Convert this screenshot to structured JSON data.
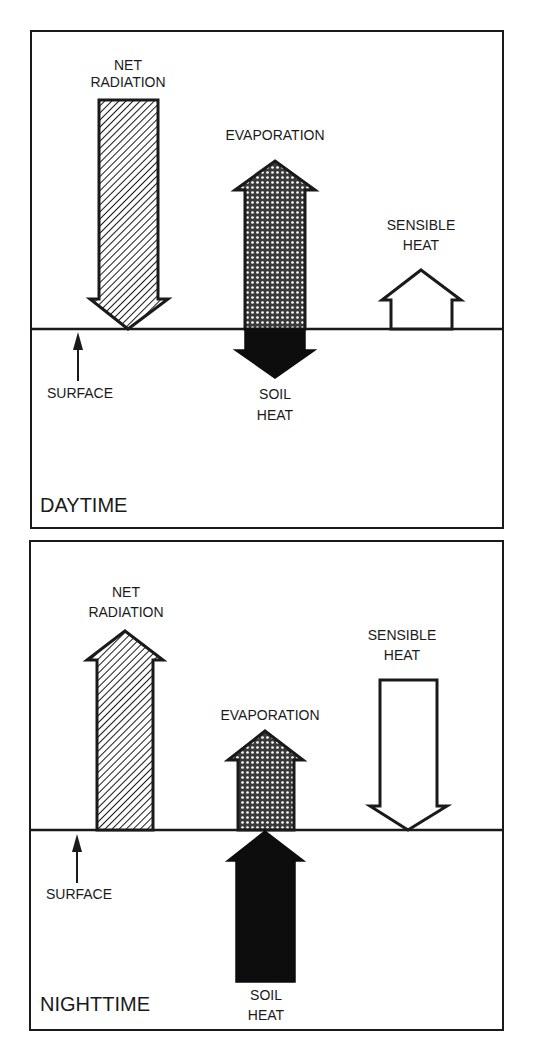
{
  "colors": {
    "ink": "#1a1a1a",
    "background": "#ffffff",
    "soil_fill": "#0d0d0d",
    "sensible_fill": "#ffffff"
  },
  "legend_patterns": {
    "net_radiation": "diagonal-hatch",
    "evaporation": "crosshatch-dots",
    "soil_heat": "solid-black",
    "sensible_heat": "open-white"
  },
  "panels": [
    {
      "id": "daytime",
      "title": "DAYTIME",
      "labels": {
        "net_radiation_line1": "NET",
        "net_radiation_line2": "RADIATION",
        "evaporation": "EVAPORATION",
        "sensible_heat_line1": "SENSIBLE",
        "sensible_heat_line2": "HEAT",
        "soil_heat_line1": "SOIL",
        "soil_heat_line2": "HEAT",
        "surface": "SURFACE"
      },
      "fluxes": {
        "net_radiation": "down",
        "evaporation": "up",
        "sensible_heat": "up",
        "soil_heat": "down"
      }
    },
    {
      "id": "nighttime",
      "title": "NIGHTTIME",
      "labels": {
        "net_radiation_line1": "NET",
        "net_radiation_line2": "RADIATION",
        "evaporation": "EVAPORATION",
        "sensible_heat_line1": "SENSIBLE",
        "sensible_heat_line2": "HEAT",
        "soil_heat_line1": "SOIL",
        "soil_heat_line2": "HEAT",
        "surface": "SURFACE"
      },
      "fluxes": {
        "net_radiation": "up",
        "evaporation": "up",
        "sensible_heat": "down",
        "soil_heat": "up"
      }
    }
  ]
}
